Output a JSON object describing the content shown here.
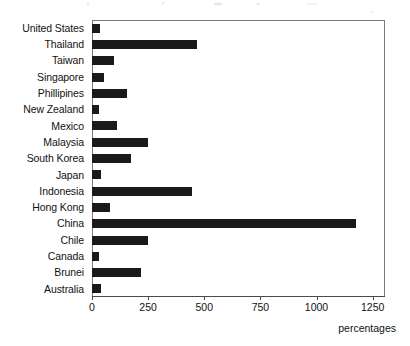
{
  "chart_data": {
    "type": "bar",
    "orientation": "horizontal",
    "title": "",
    "subtitle": "",
    "xlabel": "percentages",
    "ylabel": "",
    "xlim": [
      0,
      1305
    ],
    "grid": false,
    "legend": false,
    "xticks": [
      "0",
      "250",
      "500",
      "750",
      "1000",
      "1250"
    ],
    "xtick_values": [
      0,
      250,
      500,
      750,
      1000,
      1250
    ],
    "categories": [
      "United States",
      "Thailand",
      "Taiwan",
      "Singapore",
      "Phillipines",
      "New Zealand",
      "Mexico",
      "Malaysia",
      "South Korea",
      "Japan",
      "Indonesia",
      "Hong Kong",
      "China",
      "Chile",
      "Canada",
      "Brunei",
      "Australia"
    ],
    "values": [
      35,
      466,
      100,
      55,
      155,
      30,
      113,
      250,
      173,
      38,
      445,
      80,
      1175,
      250,
      30,
      220,
      42
    ],
    "bar_color": "#1a1a1a",
    "frame_color": "#7b7b7b"
  },
  "axis": {
    "x_title": "percentages"
  }
}
